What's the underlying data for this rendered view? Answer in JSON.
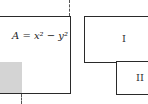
{
  "left_figure": {
    "equation": "A = x² − y²",
    "description": "Square of side x with smaller square of side y removed (shaded)"
  },
  "right_figure": {
    "regions": [
      {
        "label": "I"
      },
      {
        "label": "II"
      }
    ]
  },
  "colors": {
    "outline": "#2a2a2a",
    "shade": "#d4d4d4"
  }
}
